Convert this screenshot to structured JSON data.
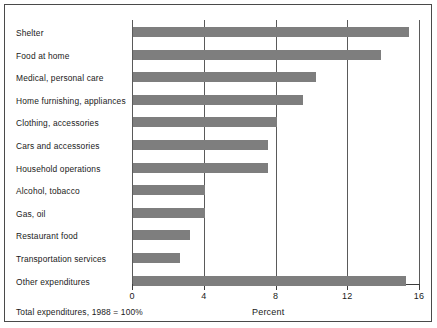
{
  "chart_data": {
    "type": "bar",
    "orientation": "horizontal",
    "title": "",
    "xlabel": "Percent",
    "ylabel": "",
    "xlim": [
      0,
      16
    ],
    "xticks": [
      0,
      4,
      8,
      12,
      16
    ],
    "xtick_labels": [
      "0",
      "4",
      "8",
      "12",
      "16"
    ],
    "grid": true,
    "legend": false,
    "footnote": "Total expenditures, 1988 = 100%",
    "bar_color": "#7e7e7e",
    "categories": [
      "Shelter",
      "Food at home",
      "Medical, personal care",
      "Home furnishing, appliances",
      "Clothing, accessories",
      "Cars and accessories",
      "Household operations",
      "Alcohol, tobacco",
      "Gas, oil",
      "Restaurant food",
      "Transportation services",
      "Other expenditures"
    ],
    "values": [
      15.4,
      13.8,
      10.2,
      9.5,
      8.0,
      7.5,
      7.5,
      4.0,
      4.0,
      3.2,
      2.6,
      15.2
    ]
  }
}
